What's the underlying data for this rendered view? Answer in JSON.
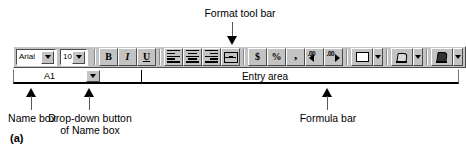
{
  "figure": {
    "label": "(a)"
  },
  "callouts": {
    "format_tool_bar": "Format tool bar",
    "name_box": "Name box",
    "dropdown_button": "Drop-down button\nof Name box",
    "dropdown_button_line1": "Drop-down button",
    "dropdown_button_line2": "of Name box",
    "formula_bar": "Formula bar"
  },
  "toolbar": {
    "font_name": {
      "value": "Arial",
      "dropdown_icon": "chevron-down-icon"
    },
    "font_size": {
      "value": "10",
      "dropdown_icon": "chevron-down-icon"
    },
    "buttons": [
      {
        "name": "bold-button",
        "label": "B",
        "icon": "bold-icon"
      },
      {
        "name": "italic-button",
        "label": "I",
        "icon": "italic-icon"
      },
      {
        "name": "underline-button",
        "label": "U",
        "icon": "underline-icon"
      },
      {
        "name": "align-left-button",
        "label": "",
        "icon": "align-left-icon"
      },
      {
        "name": "align-center-button",
        "label": "",
        "icon": "align-center-icon"
      },
      {
        "name": "align-right-button",
        "label": "",
        "icon": "align-right-icon"
      },
      {
        "name": "merge-and-center-button",
        "label": "",
        "icon": "merge-center-icon"
      },
      {
        "name": "currency-style-button",
        "label": "$",
        "icon": "currency-icon"
      },
      {
        "name": "percent-style-button",
        "label": "%",
        "icon": "percent-icon"
      },
      {
        "name": "comma-style-button",
        "label": ",",
        "icon": "comma-icon"
      },
      {
        "name": "increase-decimal-button",
        "label": "",
        "icon": "increase-decimal-icon"
      },
      {
        "name": "decrease-decimal-button",
        "label": "",
        "icon": "decrease-decimal-icon"
      },
      {
        "name": "borders-button",
        "label": "",
        "icon": "borders-icon"
      },
      {
        "name": "borders-dropdown-button",
        "label": "",
        "icon": "chevron-down-icon"
      },
      {
        "name": "fill-color-button",
        "label": "",
        "icon": "fill-color-icon"
      },
      {
        "name": "fill-color-dropdown-button",
        "label": "",
        "icon": "chevron-down-icon"
      },
      {
        "name": "font-color-button",
        "label": "",
        "icon": "font-color-icon"
      },
      {
        "name": "font-color-dropdown-button",
        "label": "",
        "icon": "chevron-down-icon"
      }
    ]
  },
  "formula_bar": {
    "name_box_value": "A1",
    "name_box_dropdown_icon": "chevron-down-icon",
    "entry_area_label": "Entry area"
  },
  "colors": {
    "chrome": "#c3c3c3",
    "shadow": "#4b4b4b",
    "highlight": "#ffffff",
    "text": "#000000",
    "leader": "#5a5a5a",
    "page_bg": "#ffffff"
  }
}
